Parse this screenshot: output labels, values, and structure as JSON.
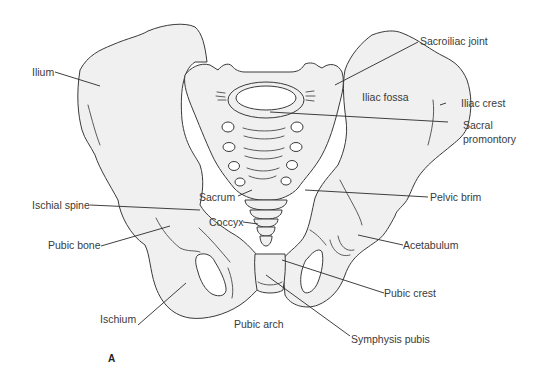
{
  "figure": {
    "panel_label": "A",
    "colors": {
      "bone_fill": "#f0f0f0",
      "outline": "#3a3a3a",
      "label_text": "#3a3a3a",
      "background": "#ffffff"
    },
    "labels": {
      "ilium": "Ilium",
      "sacroiliac_joint": "Sacroiliac joint",
      "iliac_fossa": "Iliac fossa",
      "iliac_crest": "Iliac crest",
      "sacral_promontory_line1": "Sacral",
      "sacral_promontory_line2": "promontory",
      "ischial_spine": "Ischial spine",
      "sacrum": "Sacrum",
      "coccyx": "Coccyx",
      "pelvic_brim": "Pelvic brim",
      "pubic_bone": "Pubic bone",
      "acetabulum": "Acetabulum",
      "pubic_crest": "Pubic crest",
      "ischium": "Ischium",
      "pubic_arch": "Pubic arch",
      "symphysis_pubis": "Symphysis pubis"
    }
  }
}
